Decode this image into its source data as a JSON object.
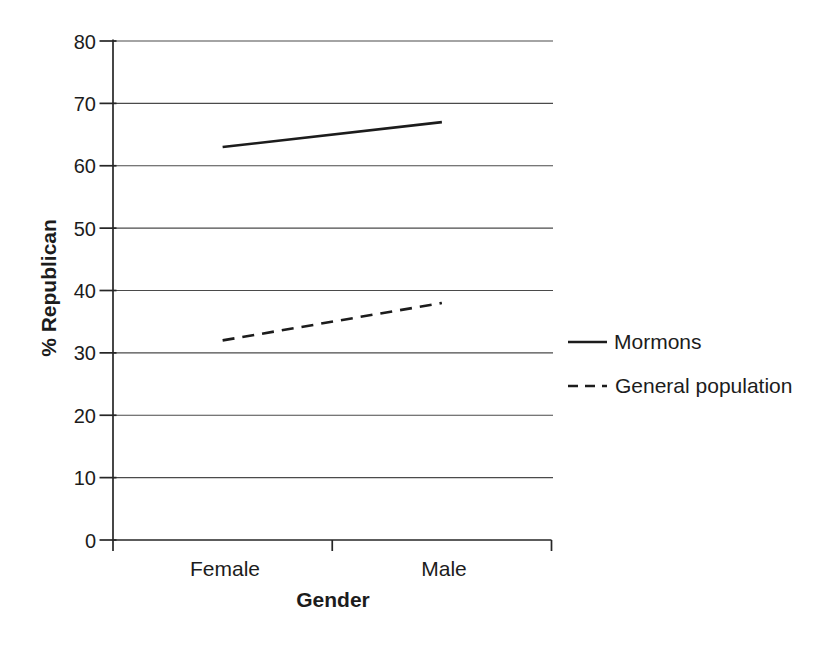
{
  "figure": {
    "background": "#ffffff",
    "text_color": "#1c1c1c",
    "gridline_color": "#4a4a4a",
    "axis_color": "#262626",
    "line_color": "#1c1c1c"
  },
  "chart_data": {
    "type": "line",
    "title": "",
    "xlabel": "Gender",
    "ylabel": "% Republican",
    "categories": [
      "Female",
      "Male"
    ],
    "series": [
      {
        "name": "Mormons",
        "dash": "solid",
        "values": [
          63,
          67
        ]
      },
      {
        "name": "General population",
        "dash": "dashed",
        "values": [
          32,
          38
        ]
      }
    ],
    "ylim": [
      0,
      80
    ],
    "ytick_step": 10,
    "yticks": [
      0,
      10,
      20,
      30,
      40,
      50,
      60,
      70,
      80
    ],
    "grid": "horizontal-only",
    "legend_position": "right-middle"
  }
}
